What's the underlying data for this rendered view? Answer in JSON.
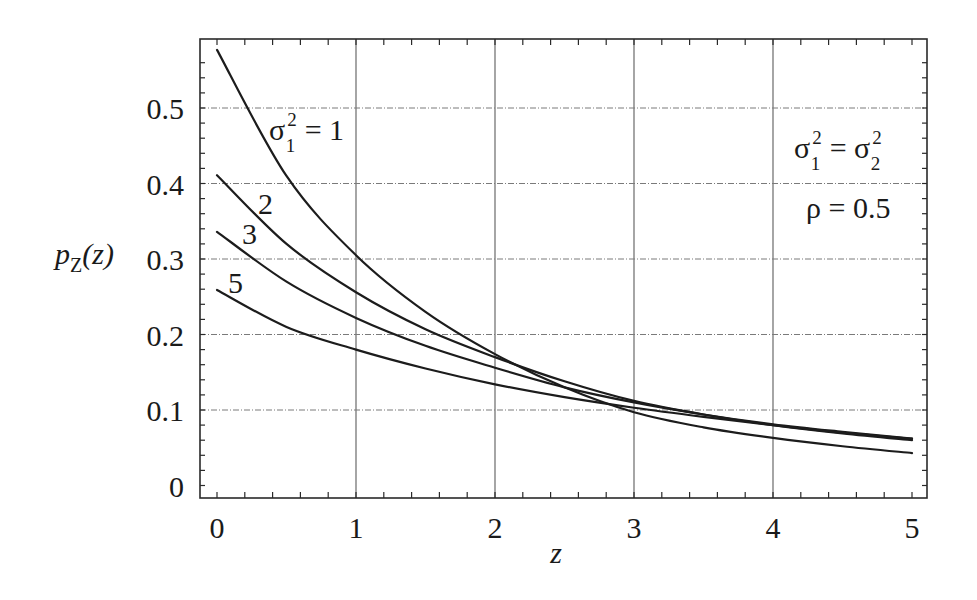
{
  "chart_data": {
    "type": "line",
    "title": "",
    "xlabel": "z",
    "ylabel": "p_Z(z)",
    "xlim": [
      0,
      5
    ],
    "ylim": [
      0,
      0.58
    ],
    "grid": true,
    "x_ticks": [
      "0",
      "1",
      "2",
      "3",
      "4",
      "5"
    ],
    "y_ticks": [
      "0",
      "0.1",
      "0.2",
      "0.3",
      "0.4",
      "0.5"
    ],
    "x": [
      0,
      0.5,
      1,
      1.5,
      2,
      2.5,
      3,
      3.5,
      4,
      4.5,
      5
    ],
    "series": [
      {
        "name": "σ1² = 1",
        "values": [
          0.577,
          0.41,
          0.305,
          0.23,
          0.174,
          0.13,
          0.097,
          0.077,
          0.063,
          0.052,
          0.043
        ]
      },
      {
        "name": "σ1² = 2",
        "values": [
          0.411,
          0.32,
          0.256,
          0.207,
          0.17,
          0.138,
          0.112,
          0.094,
          0.08,
          0.069,
          0.06
        ]
      },
      {
        "name": "σ1² = 3",
        "values": [
          0.336,
          0.27,
          0.222,
          0.185,
          0.156,
          0.13,
          0.11,
          0.094,
          0.081,
          0.071,
          0.062
        ]
      },
      {
        "name": "σ1² = 5",
        "values": [
          0.259,
          0.21,
          0.18,
          0.155,
          0.134,
          0.117,
          0.103,
          0.091,
          0.08,
          0.07,
          0.062
        ]
      }
    ],
    "curve_labels": [
      {
        "text": "σ",
        "sub": "1",
        "sup": "2",
        "suffix": " = 1"
      },
      {
        "text": "2"
      },
      {
        "text": "3"
      },
      {
        "text": "5"
      }
    ],
    "annotations": [
      {
        "line1_sigma": "σ",
        "line1_sub1": "1",
        "line1_sup1": "2",
        "line1_eq": " = ",
        "line1_sub2": "2",
        "line1_sup2": "2"
      },
      {
        "text": "ρ = 0.5"
      }
    ],
    "legend": "inline labels on curves"
  },
  "axes": {
    "ylabel_main": "p",
    "ylabel_sub": "Z",
    "ylabel_arg": "(z)",
    "xlabel": "z"
  }
}
